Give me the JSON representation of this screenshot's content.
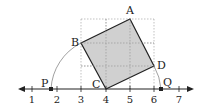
{
  "figure": {
    "number_line": {
      "ticks": [
        "1",
        "2",
        "3",
        "4",
        "5",
        "6",
        "7"
      ],
      "tick_values": [
        1,
        2,
        3,
        4,
        5,
        6,
        7
      ]
    },
    "points": {
      "A": {
        "label": "A",
        "coord": [
          5,
          3
        ]
      },
      "B": {
        "label": "B",
        "coord": [
          3,
          2
        ]
      },
      "C": {
        "label": "C",
        "coord": [
          4,
          0
        ]
      },
      "D": {
        "label": "D",
        "coord": [
          6,
          1
        ]
      },
      "P": {
        "label": "P",
        "value": "4 - √5"
      },
      "Q": {
        "label": "Q",
        "value": "4 + √5"
      }
    },
    "grid": {
      "x_range": [
        3,
        6
      ],
      "y_range": [
        0,
        3
      ]
    },
    "colors": {
      "square_fill": "#c8c8c8",
      "line": "#222222",
      "grid": "#999999"
    }
  }
}
